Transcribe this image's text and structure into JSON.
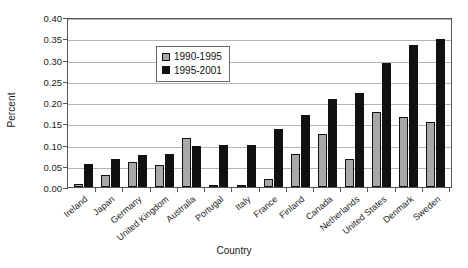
{
  "chart_data": {
    "type": "bar",
    "title": "",
    "xlabel": "Country",
    "ylabel": "Percent",
    "ylim": [
      0.0,
      0.4
    ],
    "ytick_labels": [
      "0.40",
      "0.35",
      "0.30",
      "0.25",
      "0.20",
      "0.15",
      "0.10",
      "0.05",
      "0.00"
    ],
    "ytick_values": [
      0.4,
      0.35,
      0.3,
      0.25,
      0.2,
      0.15,
      0.1,
      0.05,
      0.0
    ],
    "grid": true,
    "legend_position": "upper-left-inside",
    "categories": [
      "Ireland",
      "Japan",
      "Germany",
      "United Kingdom",
      "Australia",
      "Portugal",
      "Italy",
      "France",
      "Finland",
      "Canada",
      "Netherlands",
      "United States",
      "Denmark",
      "Sweden"
    ],
    "series": [
      {
        "name": "1990-1995",
        "color": "#a8a8a8",
        "values": [
          0.006,
          0.028,
          0.058,
          0.051,
          0.116,
          0.004,
          0.003,
          0.02,
          0.078,
          0.124,
          0.066,
          0.177,
          0.165,
          0.153
        ]
      },
      {
        "name": "1995-2001",
        "color": "#111111",
        "values": [
          0.055,
          0.065,
          0.075,
          0.078,
          0.096,
          0.099,
          0.1,
          0.137,
          0.169,
          0.207,
          0.222,
          0.292,
          0.335,
          0.349
        ]
      }
    ]
  },
  "legend": {
    "entries": [
      {
        "label": "1990-1995",
        "swatch": "gray-square-icon"
      },
      {
        "label": "1995-2001",
        "swatch": "black-square-icon"
      }
    ]
  },
  "axes": {
    "y_title": "Percent",
    "x_title": "Country"
  }
}
